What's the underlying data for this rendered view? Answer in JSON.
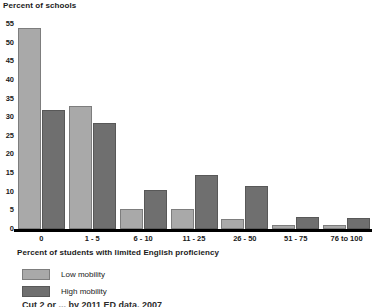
{
  "chart_data": {
    "type": "bar",
    "title": "",
    "ylabel": "Percent of schools",
    "xlabel": "Percent of students with limited English proficiency",
    "categories": [
      "0",
      "1 - 5",
      "6 - 10",
      "11 - 25",
      "26 - 50",
      "51 - 75",
      "76 to 100"
    ],
    "series": [
      {
        "name": "Low mobility",
        "color": "#a9a9a9",
        "values": [
          54,
          33,
          5.5,
          5.4,
          2.8,
          1,
          1
        ]
      },
      {
        "name": "High mobility",
        "color": "#6f6f6f",
        "values": [
          32,
          28.5,
          10.5,
          14.5,
          11.5,
          3.2,
          3
        ]
      }
    ],
    "yticks": [
      0,
      5,
      10,
      15,
      20,
      25,
      30,
      35,
      40,
      45,
      50,
      55
    ],
    "ylim": [
      0,
      55
    ],
    "grid": false,
    "legend_position": "bottom-left"
  },
  "legend": {
    "items": [
      {
        "label": "Low mobility"
      },
      {
        "label": "High mobility"
      }
    ]
  },
  "source_note": "Cut 2 or ... by 2011 ED data, 2007"
}
